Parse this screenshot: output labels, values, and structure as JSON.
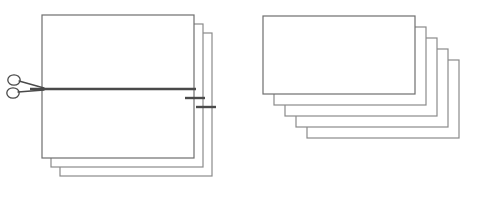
{
  "diagram": {
    "canvas": {
      "width": 477,
      "height": 200,
      "background": "#ffffff"
    },
    "colors": {
      "card_fill": "#ffffff",
      "card_stroke": "#8a8a8a",
      "card_stroke_front": "#6e6e6e",
      "cut_line": "#4a4a4a",
      "scissors": "#4a4a4a"
    },
    "strokes": {
      "card_width": 1.2,
      "cut_width": 2.4,
      "scissors_width": 1.3
    }
  },
  "left_group": {
    "label": "uncut-stack",
    "card_count": 3,
    "card_width": 152,
    "card_height": 143,
    "offset_x": 9,
    "offset_y": 9,
    "front_x": 42,
    "front_y": 15,
    "cards": [
      {
        "index": 0,
        "name": "back-sheet",
        "x": 60,
        "y": 33
      },
      {
        "index": 1,
        "name": "middle-sheet",
        "x": 51,
        "y": 24
      },
      {
        "index": 2,
        "name": "front-sheet",
        "x": 42,
        "y": 15
      }
    ]
  },
  "cut": {
    "label": "cut-line",
    "y": 89,
    "main_x1": 30,
    "main_x2": 196,
    "stubs": [
      {
        "name": "cut-stub-middle",
        "x1": 185,
        "x2": 205,
        "y": 98
      },
      {
        "name": "cut-stub-back",
        "x1": 196,
        "x2": 216,
        "y": 107
      }
    ]
  },
  "scissors": {
    "label": "scissors",
    "pivot_x": 35,
    "pivot_y": 89,
    "blade_tip_x": 44,
    "upper_handle": {
      "cx": 14,
      "cy": 80,
      "rx": 6.2,
      "ry": 5.2
    },
    "lower_handle": {
      "cx": 13,
      "cy": 93,
      "rx": 6.2,
      "ry": 5.2
    },
    "upper_blade": {
      "x1": 19,
      "y1": 81,
      "x2": 44,
      "y2": 88
    },
    "lower_blade": {
      "x1": 18,
      "y1": 92,
      "x2": 44,
      "y2": 90
    }
  },
  "right_group": {
    "label": "cut-stack",
    "card_count": 5,
    "card_width": 152,
    "card_height": 78,
    "offset_x": 11,
    "offset_y": 11,
    "front_x": 263,
    "front_y": 16,
    "cards": [
      {
        "index": 0,
        "name": "cut-sheet-5",
        "x": 307,
        "y": 60
      },
      {
        "index": 1,
        "name": "cut-sheet-4",
        "x": 296,
        "y": 49
      },
      {
        "index": 2,
        "name": "cut-sheet-3",
        "x": 285,
        "y": 38
      },
      {
        "index": 3,
        "name": "cut-sheet-2",
        "x": 274,
        "y": 27
      },
      {
        "index": 4,
        "name": "cut-sheet-1",
        "x": 263,
        "y": 16
      }
    ]
  }
}
